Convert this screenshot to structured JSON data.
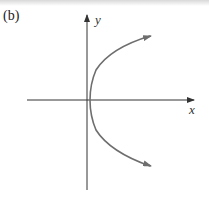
{
  "figure": {
    "panel_label": "(b)",
    "x_axis_label": "x",
    "y_axis_label": "y",
    "colors": {
      "axes": "#333333",
      "curve": "#6e6e6e",
      "background": "#ffffff"
    },
    "curve_description": "Parabola opening to the right with vertex at origin, arrows at both ends"
  }
}
